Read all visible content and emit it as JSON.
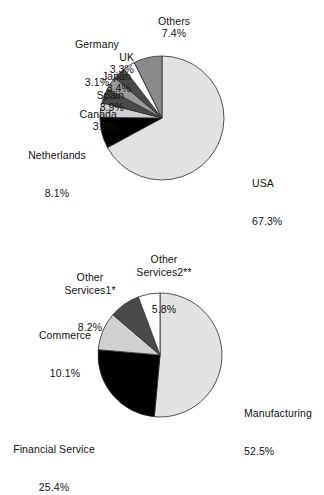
{
  "figure": {
    "background_color": "#ffffff",
    "text_color": "#111111"
  },
  "chart_data": [
    {
      "type": "pie",
      "id": "top-pie",
      "title": "",
      "subtitle": "",
      "xlabel": "",
      "ylabel": "",
      "legend_position": "callout-labels",
      "grid": false,
      "start_angle_deg": 0,
      "direction": "clockwise",
      "total_percent": 100.3,
      "categories": [
        "USA",
        "Netherlands",
        "Canada",
        "Spain",
        "Japan",
        "UK",
        "Germany",
        "Others"
      ],
      "values": [
        67.3,
        8.1,
        3.8,
        3.9,
        3.4,
        3.3,
        3.1,
        7.4
      ],
      "slices": [
        {
          "label": "USA",
          "value": 67.3,
          "value_text": "67.3%",
          "color": "#e2e2e2"
        },
        {
          "label": "Netherlands",
          "value": 8.1,
          "value_text": "8.1%",
          "color": "#000000"
        },
        {
          "label": "Canada",
          "value": 3.8,
          "value_text": "3.8%",
          "color": "#d0d0d0"
        },
        {
          "label": "Spain",
          "value": 3.9,
          "value_text": "3.9%",
          "color": "#4a4a4a"
        },
        {
          "label": "Japan",
          "value": 3.4,
          "value_text": "3.4%",
          "color": "#9a9a9a"
        },
        {
          "label": "UK",
          "value": 3.3,
          "value_text": "3.3%",
          "color": "#4a4a4a"
        },
        {
          "label": "Germany",
          "value": 3.1,
          "value_text": "3.1%",
          "color": "#ffffff"
        },
        {
          "label": "Others",
          "value": 7.4,
          "value_text": "7.4%",
          "color": "#8a8a8a"
        }
      ]
    },
    {
      "type": "pie",
      "id": "bottom-pie",
      "title": "",
      "subtitle": "",
      "xlabel": "",
      "ylabel": "",
      "legend_position": "callout-labels",
      "grid": false,
      "start_angle_deg": 0,
      "direction": "clockwise",
      "total_percent": 102.0,
      "categories": [
        "Manufacturing",
        "Financial Service",
        "Commerce",
        "Other Services1*",
        "Other Services2**"
      ],
      "values": [
        52.5,
        25.4,
        10.1,
        8.2,
        5.8
      ],
      "slices": [
        {
          "label": "Manufacturing",
          "value": 52.5,
          "value_text": "52.5%",
          "color": "#e2e2e2"
        },
        {
          "label": "Financial Service",
          "value": 25.4,
          "value_text": "25.4%",
          "color": "#000000"
        },
        {
          "label": "Commerce",
          "value": 10.1,
          "value_text": "10.1%",
          "color": "#d0d0d0"
        },
        {
          "label": "Other Services1*",
          "value": 8.2,
          "value_text": "8.2%",
          "color": "#4a4a4a"
        },
        {
          "label": "Other Services2**",
          "value": 5.8,
          "value_text": "5.8%",
          "color": "#ffffff"
        }
      ]
    }
  ],
  "top_chart": {
    "labels": {
      "others": {
        "name": "Others",
        "value": "7.4%"
      },
      "germany": {
        "name": "Germany",
        "value": "3.1%"
      },
      "uk": {
        "name": "UK",
        "value": "3.3%"
      },
      "japan": {
        "name": "Japan",
        "value": "3.4%"
      },
      "spain": {
        "name": "Spain",
        "value": "3.9%"
      },
      "canada": {
        "name": "Canada",
        "value": "3.8%"
      },
      "netherlands": {
        "name": "Netherlands",
        "value": "8.1%"
      },
      "usa": {
        "name": "USA",
        "value": "67.3%"
      }
    }
  },
  "bottom_chart": {
    "labels": {
      "other_services2": {
        "name": "Other\nServices2**",
        "value": "5.8%"
      },
      "other_services1": {
        "name": "Other\nServices1*",
        "value": "8.2%"
      },
      "commerce": {
        "name": "Commerce",
        "value": "10.1%"
      },
      "financial": {
        "name": "Financial Service",
        "value": "25.4%"
      },
      "manufacturing": {
        "name": "Manufacturing",
        "value": "52.5%"
      }
    }
  }
}
